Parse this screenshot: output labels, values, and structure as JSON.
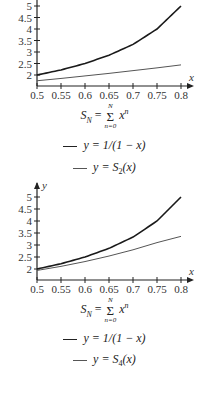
{
  "charts": [
    {
      "caption": {
        "lhs": "S",
        "lhs_sub": "N",
        "eq": "=",
        "sum_top": "N",
        "sum_bottom": "n=0",
        "term": "x",
        "term_sup": "n"
      },
      "legend": [
        {
          "label": "y = 1/(1 − x)",
          "style": "thick"
        },
        {
          "label": "y = S",
          "sub": "2",
          "tail": "(x)",
          "style": "thin"
        }
      ]
    },
    {
      "caption": {
        "lhs": "S",
        "lhs_sub": "N",
        "eq": "=",
        "sum_top": "N",
        "sum_bottom": "n=0",
        "term": "x",
        "term_sup": "n"
      },
      "legend": [
        {
          "label": "y = 1/(1 − x)",
          "style": "thick"
        },
        {
          "label": "y = S",
          "sub": "4",
          "tail": "(x)",
          "style": "thin"
        }
      ]
    }
  ],
  "chart_data": [
    {
      "type": "line",
      "title": "",
      "xlabel": "x",
      "ylabel": "y",
      "xlim": [
        0.5,
        0.8
      ],
      "ylim": [
        1.5,
        5.2
      ],
      "x_ticks": [
        "0.5",
        "0.55",
        "0.6",
        "0.65",
        "0.7",
        "0.75",
        "0.8"
      ],
      "y_ticks": [
        "2",
        "2.5",
        "3",
        "3.5",
        "4",
        "4.5",
        "5"
      ],
      "x": [
        0.5,
        0.55,
        0.6,
        0.65,
        0.7,
        0.75,
        0.8
      ],
      "series": [
        {
          "name": "y = 1/(1-x)",
          "values": [
            2.0,
            2.22,
            2.5,
            2.86,
            3.33,
            4.0,
            5.0
          ]
        },
        {
          "name": "y = S_2(x)",
          "values": [
            1.75,
            1.85,
            1.96,
            2.07,
            2.19,
            2.31,
            2.44
          ]
        }
      ],
      "grid": false,
      "legend_position": "below"
    },
    {
      "type": "line",
      "title": "",
      "xlabel": "x",
      "ylabel": "y",
      "xlim": [
        0.5,
        0.8
      ],
      "ylim": [
        1.5,
        5.2
      ],
      "x_ticks": [
        "0.5",
        "0.55",
        "0.6",
        "0.65",
        "0.7",
        "0.75",
        "0.8"
      ],
      "y_ticks": [
        "2",
        "2.5",
        "3",
        "3.5",
        "4",
        "4.5",
        "5"
      ],
      "x": [
        0.5,
        0.55,
        0.6,
        0.65,
        0.7,
        0.75,
        0.8
      ],
      "series": [
        {
          "name": "y = 1/(1-x)",
          "values": [
            2.0,
            2.22,
            2.5,
            2.86,
            3.33,
            4.0,
            5.0
          ]
        },
        {
          "name": "y = S_4(x)",
          "values": [
            1.94,
            2.11,
            2.31,
            2.54,
            2.8,
            3.1,
            3.36
          ]
        }
      ],
      "grid": false,
      "legend_position": "below"
    }
  ]
}
